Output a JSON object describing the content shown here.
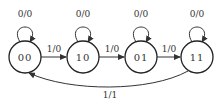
{
  "diagram": {
    "type": "state-machine",
    "states": [
      {
        "id": "00",
        "label": "00",
        "self_loop": "0/0"
      },
      {
        "id": "10",
        "label": "10",
        "self_loop": "0/0"
      },
      {
        "id": "01",
        "label": "01",
        "self_loop": "0/0"
      },
      {
        "id": "11",
        "label": "11",
        "self_loop": "0/0"
      }
    ],
    "transitions": [
      {
        "from": "00",
        "to": "10",
        "label": "1/0"
      },
      {
        "from": "10",
        "to": "01",
        "label": "1/0"
      },
      {
        "from": "01",
        "to": "11",
        "label": "1/0"
      },
      {
        "from": "11",
        "to": "00",
        "label": "1/1"
      }
    ],
    "colors": {
      "stroke": "#222222",
      "background": "#ffffff"
    }
  }
}
